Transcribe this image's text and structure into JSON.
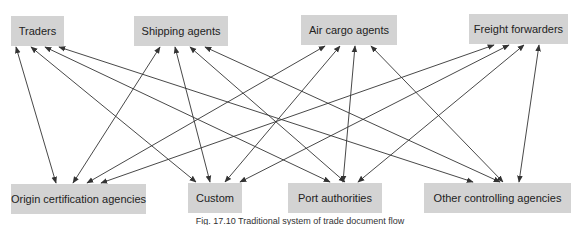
{
  "diagram": {
    "title": "Traditional system of trade document flow",
    "caption": "Fig. 17.10   Traditional system of trade document flow",
    "colors": {
      "node_fill": "#d3d3d3",
      "edge": "#333333",
      "text": "#222222"
    },
    "top_nodes": [
      {
        "id": "traders",
        "label": "Traders",
        "x": 11,
        "y": 16,
        "w": 53,
        "h": 30
      },
      {
        "id": "shipping",
        "label": "Shipping agents",
        "x": 134,
        "y": 16,
        "w": 94,
        "h": 30
      },
      {
        "id": "aircargo",
        "label": "Air cargo agents",
        "x": 301,
        "y": 15,
        "w": 96,
        "h": 30
      },
      {
        "id": "freight",
        "label": "Freight forwarders",
        "x": 469,
        "y": 14,
        "w": 99,
        "h": 30
      }
    ],
    "bottom_nodes": [
      {
        "id": "origin",
        "label": "Origin certification agencies",
        "x": 11,
        "y": 184,
        "w": 135,
        "h": 30
      },
      {
        "id": "custom",
        "label": "Custom",
        "x": 188,
        "y": 183,
        "w": 54,
        "h": 30
      },
      {
        "id": "port",
        "label": "Port authorities",
        "x": 288,
        "y": 183,
        "w": 94,
        "h": 30
      },
      {
        "id": "other",
        "label": "Other controlling agencies",
        "x": 424,
        "y": 183,
        "w": 147,
        "h": 30
      }
    ],
    "edges": [
      {
        "from": "traders",
        "to": "origin",
        "x1": 16,
        "y1": 47,
        "x2": 56,
        "y2": 183
      },
      {
        "from": "traders",
        "to": "custom",
        "x1": 31,
        "y1": 47,
        "x2": 196,
        "y2": 182
      },
      {
        "from": "traders",
        "to": "port",
        "x1": 45,
        "y1": 47,
        "x2": 330,
        "y2": 182
      },
      {
        "from": "traders",
        "to": "other",
        "x1": 59,
        "y1": 47,
        "x2": 473,
        "y2": 182
      },
      {
        "from": "shipping",
        "to": "origin",
        "x1": 160,
        "y1": 47,
        "x2": 73,
        "y2": 183
      },
      {
        "from": "shipping",
        "to": "custom",
        "x1": 175,
        "y1": 47,
        "x2": 210,
        "y2": 182
      },
      {
        "from": "shipping",
        "to": "port",
        "x1": 190,
        "y1": 47,
        "x2": 345,
        "y2": 182
      },
      {
        "from": "shipping",
        "to": "other",
        "x1": 205,
        "y1": 47,
        "x2": 500,
        "y2": 182
      },
      {
        "from": "aircargo",
        "to": "origin",
        "x1": 325,
        "y1": 46,
        "x2": 87,
        "y2": 183
      },
      {
        "from": "aircargo",
        "to": "custom",
        "x1": 340,
        "y1": 46,
        "x2": 225,
        "y2": 182
      },
      {
        "from": "aircargo",
        "to": "port",
        "x1": 355,
        "y1": 46,
        "x2": 343,
        "y2": 182
      },
      {
        "from": "aircargo",
        "to": "other",
        "x1": 371,
        "y1": 46,
        "x2": 503,
        "y2": 182
      },
      {
        "from": "freight",
        "to": "origin",
        "x1": 494,
        "y1": 45,
        "x2": 101,
        "y2": 183
      },
      {
        "from": "freight",
        "to": "custom",
        "x1": 509,
        "y1": 45,
        "x2": 240,
        "y2": 182
      },
      {
        "from": "freight",
        "to": "port",
        "x1": 524,
        "y1": 45,
        "x2": 358,
        "y2": 182
      },
      {
        "from": "freight",
        "to": "other",
        "x1": 539,
        "y1": 45,
        "x2": 519,
        "y2": 182
      }
    ]
  }
}
